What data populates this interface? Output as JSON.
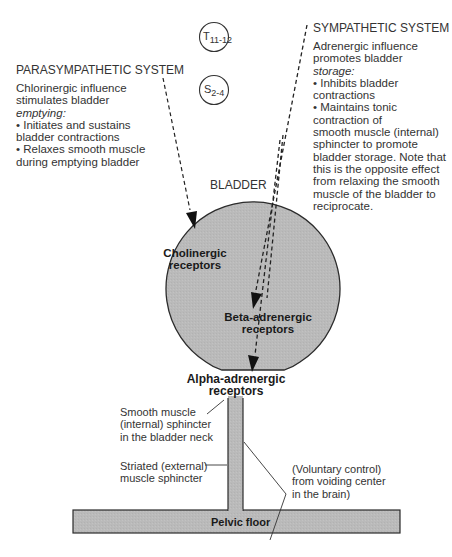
{
  "parasympathetic": {
    "title": "PARASYMPATHETIC SYSTEM",
    "lines": [
      "Chlorinergic influence",
      "stimulates bladder"
    ],
    "emphasis": "emptying:",
    "bullets": [
      "• Initiates and sustains",
      "bladder contractions",
      "• Relaxes smooth muscle",
      "during emptying bladder"
    ]
  },
  "sympathetic": {
    "title": "SYMPATHETIC SYSTEM",
    "lines": [
      "Adrenergic influence",
      "promotes bladder"
    ],
    "emphasis": "storage:",
    "bullets": [
      "• Inhibits bladder",
      "contractions",
      "• Maintains tonic",
      "contraction of",
      "smooth muscle (internal)",
      "sphincter to promote",
      "bladder storage. Note that",
      "this is the opposite effect",
      "from relaxing the smooth",
      "muscle of the bladder to",
      "reciprocate."
    ]
  },
  "spinal_segments": {
    "t": {
      "letter": "T",
      "sub": "11-12"
    },
    "s": {
      "letter": "S",
      "sub": "2-4"
    }
  },
  "bladder": {
    "label": "BLADDER",
    "cholinergic": [
      "Cholinergic",
      "receptors"
    ],
    "beta": [
      "Beta-adrenergic",
      "receptors"
    ],
    "alpha": [
      "Alpha-adrenergic",
      "receptors"
    ]
  },
  "labels": {
    "internal_sphincter": [
      "Smooth muscle",
      "(internal) sphincter",
      "in the bladder neck"
    ],
    "external_sphincter": [
      "Striated (external)",
      "muscle sphincter"
    ],
    "voluntary": [
      "(Voluntary control)",
      "from voiding center",
      "in the brain)"
    ],
    "pelvic_floor": "Pelvic floor"
  },
  "colors": {
    "fill": "#b9b9b9",
    "stroke": "#2b2b2b",
    "text": "#333333"
  }
}
